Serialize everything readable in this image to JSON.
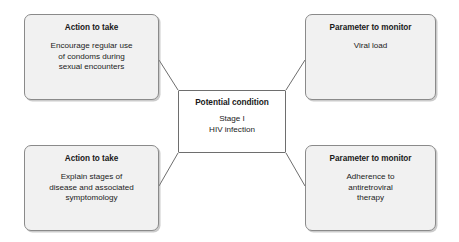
{
  "diagram": {
    "type": "concept-map",
    "center": {
      "id": "potential-condition",
      "title": "Potential condition",
      "body": "Stage I\nHIV infection",
      "fill": "#ffffff",
      "border": "#6e6e6e"
    },
    "nodes": [
      {
        "id": "action-top-left",
        "position": "top-left",
        "title": "Action to take",
        "body": "Encourage regular use\nof condoms during\nsexual encounters",
        "fill": "#f1f1f1",
        "border": "#8a8a8a"
      },
      {
        "id": "parameter-top-right",
        "position": "top-right",
        "title": "Parameter to monitor",
        "body": "Viral load",
        "fill": "#f1f1f1",
        "border": "#8a8a8a"
      },
      {
        "id": "action-bottom-left",
        "position": "bottom-left",
        "title": "Action to take",
        "body": "Explain stages of\ndisease and associated\nsymptomology",
        "fill": "#f1f1f1",
        "border": "#8a8a8a"
      },
      {
        "id": "parameter-bottom-right",
        "position": "bottom-right",
        "title": "Parameter to monitor",
        "body": "Adherence to\nantiretroviral\ntherapy",
        "fill": "#f1f1f1",
        "border": "#8a8a8a"
      }
    ],
    "connectors": [
      {
        "id": "connector-center-to-top-left",
        "from": "potential-condition",
        "to": "action-top-left",
        "x1": 178,
        "y1": 90,
        "x2": 159,
        "y2": 60
      },
      {
        "id": "connector-center-to-top-right",
        "from": "potential-condition",
        "to": "parameter-top-right",
        "x1": 286,
        "y1": 90,
        "x2": 305,
        "y2": 60
      },
      {
        "id": "connector-center-to-bottom-left",
        "from": "potential-condition",
        "to": "action-bottom-left",
        "x1": 178,
        "y1": 153,
        "x2": 159,
        "y2": 186
      },
      {
        "id": "connector-center-to-bottom-right",
        "from": "potential-condition",
        "to": "parameter-bottom-right",
        "x1": 286,
        "y1": 153,
        "x2": 305,
        "y2": 186
      }
    ],
    "line_color": "#6e6e6e",
    "background": "#ffffff"
  }
}
